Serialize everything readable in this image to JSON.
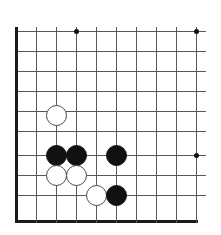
{
  "board": {
    "title": "Go board diagram",
    "game": "Go",
    "geometry": {
      "origin_x": 16,
      "origin_y": 31,
      "cell": 20,
      "columns": 10,
      "rows": 10,
      "bottom_edge_y": 221,
      "stone_diameter": 21
    },
    "colors": {
      "background": "#ffffff",
      "grid": "#58585a",
      "edge": "#1a1a1a",
      "black_stone": "#111111",
      "white_stone": "#ffffff",
      "white_stone_outline": "#4a4a4c"
    },
    "columns_x": [
      16,
      36,
      56,
      76,
      96,
      116,
      136,
      156,
      176,
      196
    ],
    "rows_y": [
      31,
      51,
      71,
      91,
      111,
      131,
      155,
      175,
      195,
      221
    ],
    "edges": {
      "left_x": 16,
      "bottom_y": 221
    },
    "star_points": [
      {
        "name": "star-top-left",
        "x": 76,
        "y": 31
      },
      {
        "name": "star-top-right",
        "x": 196,
        "y": 31
      },
      {
        "name": "star-right-middle",
        "x": 196,
        "y": 155
      }
    ],
    "stones": [
      {
        "name": "white-stone-1",
        "color": "white",
        "x": 56,
        "y": 115
      },
      {
        "name": "black-stone-1",
        "color": "black",
        "x": 56,
        "y": 155
      },
      {
        "name": "black-stone-2",
        "color": "black",
        "x": 76,
        "y": 155
      },
      {
        "name": "black-stone-3",
        "color": "black",
        "x": 116,
        "y": 155
      },
      {
        "name": "white-stone-2",
        "color": "white",
        "x": 56,
        "y": 175
      },
      {
        "name": "white-stone-3",
        "color": "white",
        "x": 76,
        "y": 175
      },
      {
        "name": "white-stone-4",
        "color": "white",
        "x": 96,
        "y": 195
      },
      {
        "name": "black-stone-4",
        "color": "black",
        "x": 116,
        "y": 195
      }
    ],
    "counts": {
      "black_stones": 4,
      "white_stones": 4,
      "total_stones": 8
    }
  },
  "chart_data": {
    "type": "table",
    "xlabel": "",
    "ylabel": "",
    "columns": [
      "stone",
      "color",
      "x",
      "y"
    ],
    "rows": [
      [
        "white-stone-1",
        "white",
        56,
        115
      ],
      [
        "black-stone-1",
        "black",
        56,
        155
      ],
      [
        "black-stone-2",
        "black",
        76,
        155
      ],
      [
        "black-stone-3",
        "black",
        116,
        155
      ],
      [
        "white-stone-2",
        "white",
        56,
        175
      ],
      [
        "white-stone-3",
        "white",
        76,
        175
      ],
      [
        "white-stone-4",
        "white",
        96,
        195
      ],
      [
        "black-stone-4",
        "black",
        116,
        195
      ]
    ]
  }
}
